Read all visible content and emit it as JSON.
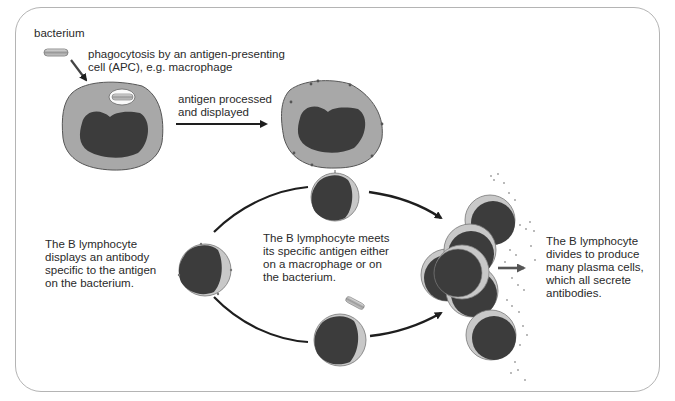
{
  "labels": {
    "bacterium": "bacterium",
    "phagocytosis_line1": "phagocytosis by an antigen-presenting",
    "phagocytosis_line2": "cell (APC), e.g. macrophage",
    "antigen_line1": "antigen processed",
    "antigen_line2": "and displayed",
    "b_display_line1": "The B lymphocyte",
    "b_display_line2": "displays an antibody",
    "b_display_line3": "specific to the antigen",
    "b_display_line4": "on the bacterium.",
    "b_meets_line1": "The B lymphocyte meets",
    "b_meets_line2": "its specific antigen either",
    "b_meets_line3": "on a macrophage or on",
    "b_meets_line4": "the bacterium.",
    "b_divides_line1": "The B lymphocyte",
    "b_divides_line2": "divides to produce",
    "b_divides_line3": "many plasma cells,",
    "b_divides_line4": "which all secrete",
    "b_divides_line5": "antibodies."
  },
  "colors": {
    "cytoplasm": "#a8a8a8",
    "nucleus": "#3c3c3c",
    "lymph_rim": "#c8c8c8",
    "arrow": "#1e1e1e",
    "border": "#b4b4b4",
    "text": "#2a2a2a"
  }
}
